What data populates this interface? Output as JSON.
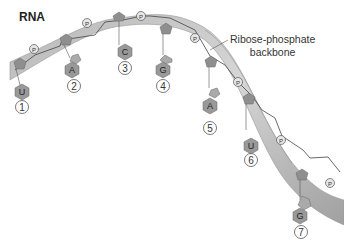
{
  "title": "RNA",
  "backbone_label": [
    "Ribose-phosphate",
    "backbone"
  ],
  "phosphate_label": "P",
  "nucleotides": [
    {
      "index": "1",
      "base": "U"
    },
    {
      "index": "2",
      "base": "A"
    },
    {
      "index": "3",
      "base": "C"
    },
    {
      "index": "4",
      "base": "G"
    },
    {
      "index": "5",
      "base": "A"
    },
    {
      "index": "6",
      "base": "U"
    },
    {
      "index": "7",
      "base": "G"
    }
  ],
  "colors": {
    "backbone_fill": "#c8c8c8",
    "backbone_dark": "#9a9a9a",
    "sugar": "#8f8f8f",
    "base": "#a8a8a8",
    "circle_stroke": "#555555"
  }
}
